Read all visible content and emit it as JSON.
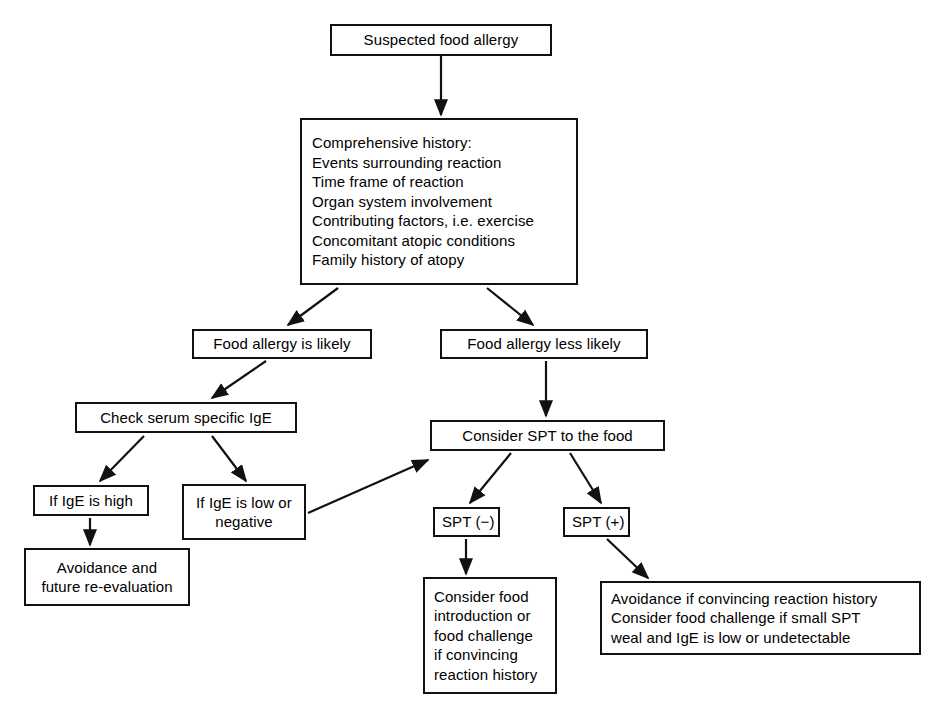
{
  "figure": {
    "type": "flowchart",
    "background_color": "#ffffff",
    "stroke_color": "#111111",
    "text_color": "#000000"
  },
  "nodes": {
    "suspected": {
      "lines": [
        "Suspected food allergy"
      ],
      "x": 330,
      "y": 24,
      "w": 222,
      "h": 32,
      "align": "center"
    },
    "history": {
      "lines": [
        "Comprehensive history:",
        "Events surrounding reaction",
        "Time frame of reaction",
        "Organ system involvement",
        "Contributing factors, i.e. exercise",
        "Concomitant atopic conditions",
        "Family history of atopy"
      ],
      "x": 300,
      "y": 118,
      "w": 278,
      "h": 167,
      "align": "left"
    },
    "likely": {
      "lines": [
        "Food allergy is likely"
      ],
      "x": 192,
      "y": 329,
      "w": 180,
      "h": 30,
      "align": "center"
    },
    "less_likely": {
      "lines": [
        "Food allergy less likely"
      ],
      "x": 440,
      "y": 329,
      "w": 208,
      "h": 30,
      "align": "center"
    },
    "check_ige": {
      "lines": [
        "Check serum specific IgE"
      ],
      "x": 75,
      "y": 402,
      "w": 222,
      "h": 31,
      "align": "center"
    },
    "consider_spt": {
      "lines": [
        "Consider SPT to the food"
      ],
      "x": 430,
      "y": 420,
      "w": 235,
      "h": 31,
      "align": "center"
    },
    "ige_high": {
      "lines": [
        "If IgE is high"
      ],
      "x": 33,
      "y": 485,
      "w": 116,
      "h": 31,
      "align": "center"
    },
    "ige_low": {
      "lines": [
        "If IgE is low or",
        "negative"
      ],
      "x": 182,
      "y": 484,
      "w": 124,
      "h": 56,
      "align": "center"
    },
    "avoidance_future": {
      "lines": [
        "Avoidance and",
        "future re-evaluation"
      ],
      "x": 24,
      "y": 548,
      "w": 166,
      "h": 58,
      "align": "center"
    },
    "spt_neg": {
      "lines": [
        "SPT (−)"
      ],
      "x": 433,
      "y": 507,
      "w": 67,
      "h": 30,
      "align": "left"
    },
    "spt_pos": {
      "lines": [
        "SPT (+)"
      ],
      "x": 563,
      "y": 507,
      "w": 67,
      "h": 30,
      "align": "left"
    },
    "consider_food": {
      "lines": [
        "Consider food",
        "introduction or",
        "food challenge",
        "if convincing",
        "reaction history"
      ],
      "x": 423,
      "y": 577,
      "w": 134,
      "h": 117,
      "align": "left"
    },
    "avoidance_convincing": {
      "lines": [
        "Avoidance if convincing reaction history",
        "Consider food challenge if small SPT",
        "weal and IgE is low or undetectable"
      ],
      "x": 600,
      "y": 581,
      "w": 321,
      "h": 74,
      "align": "left"
    }
  },
  "edges": [
    {
      "name": "suspected-to-history",
      "from": "suspected",
      "to": "history",
      "kind": "vertical"
    },
    {
      "name": "history-to-likely",
      "from": "history",
      "to": "likely",
      "kind": "diagonal"
    },
    {
      "name": "history-to-less-likely",
      "from": "history",
      "to": "less_likely",
      "kind": "diagonal"
    },
    {
      "name": "likely-to-check-ige",
      "from": "likely",
      "to": "check_ige",
      "kind": "diagonal"
    },
    {
      "name": "less-likely-to-consider-spt",
      "from": "less_likely",
      "to": "consider_spt",
      "kind": "vertical"
    },
    {
      "name": "check-ige-to-ige-high",
      "from": "check_ige",
      "to": "ige_high",
      "kind": "diagonal"
    },
    {
      "name": "check-ige-to-ige-low",
      "from": "check_ige",
      "to": "ige_low",
      "kind": "diagonal"
    },
    {
      "name": "ige-high-to-avoidance-future",
      "from": "ige_high",
      "to": "avoidance_future",
      "kind": "vertical"
    },
    {
      "name": "ige-low-to-consider-spt",
      "from": "ige_low",
      "to": "consider_spt",
      "kind": "diagonal"
    },
    {
      "name": "consider-spt-to-spt-neg",
      "from": "consider_spt",
      "to": "spt_neg",
      "kind": "diagonal"
    },
    {
      "name": "consider-spt-to-spt-pos",
      "from": "consider_spt",
      "to": "spt_pos",
      "kind": "diagonal"
    },
    {
      "name": "spt-neg-to-consider-food",
      "from": "spt_neg",
      "to": "consider_food",
      "kind": "vertical"
    },
    {
      "name": "spt-pos-to-avoidance-convincing",
      "from": "spt_pos",
      "to": "avoidance_convincing",
      "kind": "diagonal"
    }
  ],
  "edge_geometry": [
    {
      "name": "suspected-to-history",
      "x1": 441,
      "y1": 56,
      "x2": 441,
      "y2": 115
    },
    {
      "name": "history-to-likely",
      "x1": 338,
      "y1": 288,
      "x2": 288,
      "y2": 325
    },
    {
      "name": "history-to-less-likely",
      "x1": 487,
      "y1": 288,
      "x2": 533,
      "y2": 325
    },
    {
      "name": "likely-to-check-ige",
      "x1": 266,
      "y1": 361,
      "x2": 212,
      "y2": 398
    },
    {
      "name": "less-likely-to-consider-spt",
      "x1": 546,
      "y1": 361,
      "x2": 546,
      "y2": 416
    },
    {
      "name": "check-ige-to-ige-high",
      "x1": 144,
      "y1": 436,
      "x2": 100,
      "y2": 481
    },
    {
      "name": "check-ige-to-ige-low",
      "x1": 212,
      "y1": 436,
      "x2": 246,
      "y2": 481
    },
    {
      "name": "ige-high-to-avoidance-future",
      "x1": 90,
      "y1": 518,
      "x2": 90,
      "y2": 545
    },
    {
      "name": "ige-low-to-consider-spt",
      "x1": 308,
      "y1": 513,
      "x2": 428,
      "y2": 460
    },
    {
      "name": "consider-spt-to-spt-neg",
      "x1": 511,
      "y1": 453,
      "x2": 470,
      "y2": 503
    },
    {
      "name": "consider-spt-to-spt-pos",
      "x1": 570,
      "y1": 453,
      "x2": 601,
      "y2": 503
    },
    {
      "name": "spt-neg-to-consider-food",
      "x1": 466,
      "y1": 539,
      "x2": 466,
      "y2": 574
    },
    {
      "name": "spt-pos-to-avoidance-convincing",
      "x1": 607,
      "y1": 539,
      "x2": 648,
      "y2": 578
    }
  ]
}
